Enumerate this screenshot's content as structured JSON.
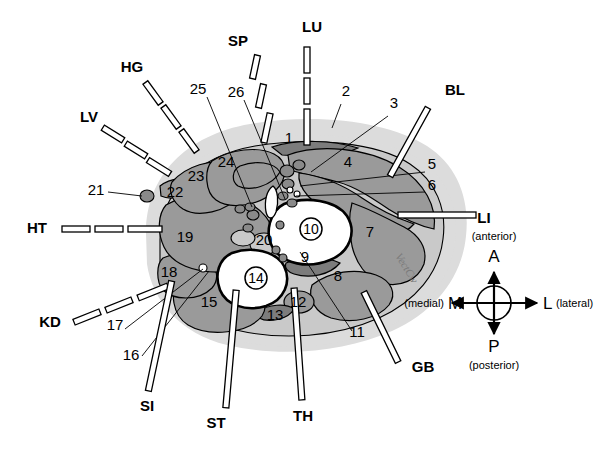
{
  "figure": {
    "kind": "anatomical-cross-section",
    "organ_labels": [
      {
        "id": "LU",
        "label": "LU",
        "leader": "dashed-vertical",
        "x": 312,
        "y": 32
      },
      {
        "id": "SP",
        "label": "SP",
        "leader": "dashed-diagonal",
        "x": 238,
        "y": 46
      },
      {
        "id": "HG",
        "label": "HG",
        "leader": "dashed-diagonal",
        "x": 132,
        "y": 72
      },
      {
        "id": "LV",
        "label": "LV",
        "leader": "dashed-diagonal",
        "x": 89,
        "y": 122
      },
      {
        "id": "HT",
        "label": "HT",
        "leader": "dashed-horizontal",
        "x": 37,
        "y": 233
      },
      {
        "id": "KD",
        "label": "KD",
        "leader": "dashed-diagonal",
        "x": 50,
        "y": 327
      },
      {
        "id": "SI",
        "label": "SI",
        "leader": "solid-bar",
        "x": 147,
        "y": 411
      },
      {
        "id": "ST",
        "label": "ST",
        "leader": "solid-bar",
        "x": 216,
        "y": 428
      },
      {
        "id": "TH",
        "label": "TH",
        "leader": "solid-bar",
        "x": 303,
        "y": 421
      },
      {
        "id": "GB",
        "label": "GB",
        "leader": "solid-bar",
        "x": 423,
        "y": 372
      },
      {
        "id": "LI",
        "label": "LI",
        "leader": "solid-bar",
        "x": 484,
        "y": 223
      },
      {
        "id": "BL",
        "label": "BL",
        "leader": "solid-bar",
        "x": 455,
        "y": 95
      }
    ],
    "numbered_structures": [
      {
        "n": "1",
        "x": 289,
        "y": 143
      },
      {
        "n": "2",
        "x": 346,
        "y": 96
      },
      {
        "n": "3",
        "x": 394,
        "y": 108
      },
      {
        "n": "4",
        "x": 348,
        "y": 167
      },
      {
        "n": "5",
        "x": 432,
        "y": 169
      },
      {
        "n": "6",
        "x": 432,
        "y": 190
      },
      {
        "n": "7",
        "x": 370,
        "y": 237
      },
      {
        "n": "8",
        "x": 338,
        "y": 281
      },
      {
        "n": "9",
        "x": 305,
        "y": 262
      },
      {
        "n": "10",
        "x": 311,
        "y": 229,
        "circled": true
      },
      {
        "n": "11",
        "x": 357,
        "y": 337
      },
      {
        "n": "12",
        "x": 298,
        "y": 301
      },
      {
        "n": "13",
        "x": 275,
        "y": 315
      },
      {
        "n": "14",
        "x": 256,
        "y": 278,
        "circled": true
      },
      {
        "n": "15",
        "x": 209,
        "y": 307
      },
      {
        "n": "16",
        "x": 131,
        "y": 360
      },
      {
        "n": "17",
        "x": 115,
        "y": 330
      },
      {
        "n": "18",
        "x": 169,
        "y": 272
      },
      {
        "n": "19",
        "x": 185,
        "y": 237
      },
      {
        "n": "20",
        "x": 264,
        "y": 240
      },
      {
        "n": "21",
        "x": 96,
        "y": 190
      },
      {
        "n": "22",
        "x": 175,
        "y": 192
      },
      {
        "n": "23",
        "x": 196,
        "y": 176
      },
      {
        "n": "24",
        "x": 226,
        "y": 162
      },
      {
        "n": "25",
        "x": 198,
        "y": 89
      },
      {
        "n": "26",
        "x": 236,
        "y": 92
      }
    ],
    "compass": {
      "anterior_abbr": "A",
      "anterior_word": "(anterior)",
      "posterior_abbr": "P",
      "posterior_word": "(posterior)",
      "medial_abbr": "M",
      "medial_word": "(medial)",
      "lateral_abbr": "L",
      "lateral_word": "(lateral)",
      "cx": 494,
      "cy": 303
    },
    "signature": "VectCw",
    "colors": {
      "halo": "#dcdcdc",
      "light_tissue": "#c9c9c9",
      "muscle": "#9a9a9a",
      "dark_tissue": "#7c7c7c",
      "lumen": "#ffffff",
      "outline": "#000000",
      "background": "#ffffff"
    }
  }
}
